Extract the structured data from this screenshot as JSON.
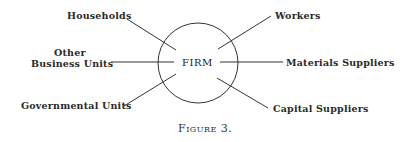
{
  "diagram": {
    "center": "FIRM",
    "left": [
      {
        "label": "Households"
      },
      {
        "label_line1": "Other",
        "label_line2": "Business Units"
      },
      {
        "label": "Governmental Units"
      }
    ],
    "right": [
      {
        "label": "Workers"
      },
      {
        "label": "Materials Suppliers"
      },
      {
        "label": "Capital Suppliers"
      }
    ],
    "caption": "Figure 3."
  }
}
